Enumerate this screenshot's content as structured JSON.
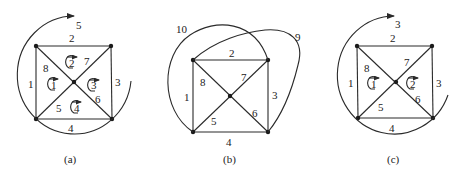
{
  "figures": [
    {
      "id": "a",
      "caption": "(a)",
      "edge_labels": {
        "e1": "1",
        "e2": "2",
        "e3": "3",
        "e4": "4",
        "e5": "5",
        "e6": "6",
        "e7": "7",
        "e8": "8",
        "outer": "5"
      },
      "mesh_labels": [
        "1",
        "2",
        "3",
        "4"
      ]
    },
    {
      "id": "b",
      "caption": "(b)",
      "edge_labels": {
        "e1": "1",
        "e2": "2",
        "e3": "3",
        "e4": "4",
        "e5": "5",
        "e6": "6",
        "e7": "7",
        "e8": "8",
        "e9": "9",
        "e10": "10"
      }
    },
    {
      "id": "c",
      "caption": "(c)",
      "edge_labels": {
        "e1": "1",
        "e2": "2",
        "e3": "3",
        "e4": "4",
        "e5": "5",
        "e6": "6",
        "e7": "7",
        "e8": "8",
        "outer": "3"
      },
      "mesh_labels": [
        "1",
        "2"
      ]
    }
  ],
  "colors": {
    "line": "#2a2a2a",
    "background": "#ffffff"
  }
}
